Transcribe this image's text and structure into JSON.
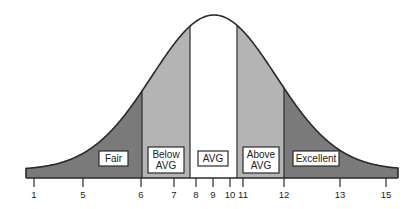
{
  "diagram": {
    "type": "bell-curve",
    "colors": {
      "dark": "#7a7a7a",
      "light": "#b4b4b4",
      "center": "#ffffff",
      "stroke": "#2a2a2a",
      "label_bg": "#ffffff"
    },
    "regions": [
      {
        "id": "fair",
        "label_lines": [
          "Fair"
        ],
        "from": 1,
        "to": 6,
        "fill": "dark"
      },
      {
        "id": "below-avg",
        "label_lines": [
          "Below",
          "AVG"
        ],
        "from": 6,
        "to": 8,
        "fill": "light"
      },
      {
        "id": "avg",
        "label_lines": [
          "AVG"
        ],
        "from": 8,
        "to": 11,
        "fill": "center"
      },
      {
        "id": "above-avg",
        "label_lines": [
          "Above",
          "AVG"
        ],
        "from": 11,
        "to": 12,
        "fill": "light"
      },
      {
        "id": "excellent",
        "label_lines": [
          "Excellent"
        ],
        "from": 12,
        "to": 15,
        "fill": "dark"
      }
    ],
    "ticks": [
      {
        "label": "1",
        "x": 34
      },
      {
        "label": "5",
        "x": 83
      },
      {
        "label": "6",
        "x": 141
      },
      {
        "label": "7",
        "x": 174
      },
      {
        "label": "8",
        "x": 196
      },
      {
        "label": "9",
        "x": 213
      },
      {
        "label": "10",
        "x": 230
      },
      {
        "label": "11",
        "x": 243
      },
      {
        "label": "12",
        "x": 284
      },
      {
        "label": "13",
        "x": 340
      },
      {
        "label": "15",
        "x": 386
      }
    ]
  },
  "chart_data": {
    "type": "area",
    "title": "",
    "xlabel": "",
    "ylabel": "",
    "x_tick_labels": [
      "1",
      "5",
      "6",
      "7",
      "8",
      "9",
      "10",
      "11",
      "12",
      "13",
      "15"
    ],
    "segments": [
      {
        "name": "Fair",
        "range": [
          1,
          6
        ]
      },
      {
        "name": "Below AVG",
        "range": [
          6,
          8
        ]
      },
      {
        "name": "AVG",
        "range": [
          8,
          11
        ]
      },
      {
        "name": "Above AVG",
        "range": [
          11,
          12
        ]
      },
      {
        "name": "Excellent",
        "range": [
          12,
          15
        ]
      }
    ],
    "grid": false,
    "legend": "none"
  }
}
